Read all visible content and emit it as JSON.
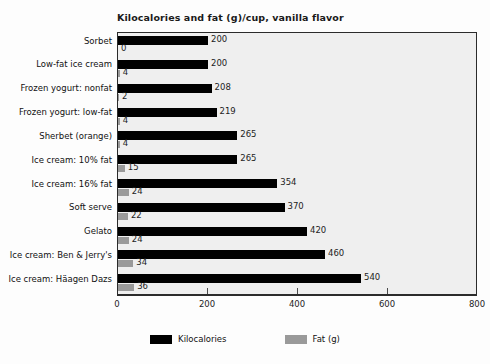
{
  "chart_data": {
    "type": "bar",
    "orientation": "horizontal",
    "title": "Kilocalories and fat (g)/cup, vanilla flavor",
    "xlabel": "",
    "ylabel": "",
    "xlim": [
      0,
      800
    ],
    "xticks": [
      0,
      200,
      400,
      600,
      800
    ],
    "xtick_labels": [
      "0",
      "200",
      "400",
      "600",
      "800"
    ],
    "grid": false,
    "legend_position": "bottom",
    "categories": [
      "Sorbet",
      "Low-fat ice cream",
      "Frozen yogurt: nonfat",
      "Frozen yogurt: low-fat",
      "Sherbet (orange)",
      "Ice cream: 10% fat",
      "Ice cream: 16% fat",
      "Soft serve",
      "Gelato",
      "Ice cream: Ben & Jerry's",
      "Ice cream: Häagen Dazs"
    ],
    "series": [
      {
        "name": "Kilocalories",
        "color": "#000000",
        "values": [
          200,
          200,
          208,
          219,
          265,
          265,
          354,
          370,
          420,
          460,
          540
        ],
        "value_labels": [
          "200",
          "200",
          "208",
          "219",
          "265",
          "265",
          "354",
          "370",
          "420",
          "460",
          "540"
        ]
      },
      {
        "name": "Fat (g)",
        "color": "#9a9a9a",
        "values": [
          0,
          4,
          2,
          4,
          4,
          15,
          24,
          22,
          24,
          34,
          36
        ],
        "value_labels": [
          "0",
          "4",
          "2",
          "4",
          "4",
          "15",
          "24",
          "22",
          "24",
          "34",
          "36"
        ]
      }
    ]
  },
  "legend": {
    "items": [
      {
        "label": "Kilocalories",
        "color": "#000000"
      },
      {
        "label": "Fat (g)",
        "color": "#9a9a9a"
      }
    ]
  },
  "colors": {
    "kilocalories": "#000000",
    "fat": "#9a9a9a",
    "plot_background": "#efefef",
    "frame": "#2b2b2b",
    "page_background": "#fdfdfd",
    "text": "#111111"
  }
}
